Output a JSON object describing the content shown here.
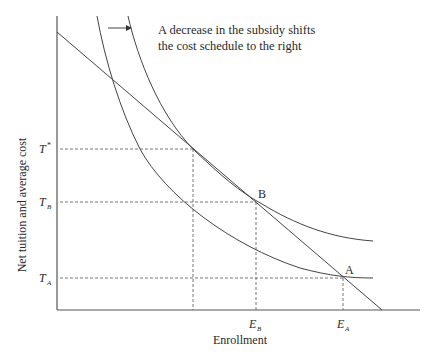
{
  "diagram": {
    "annotation": {
      "line1": "A decrease in the subsidy shifts",
      "line2": "the cost schedule to the right"
    },
    "axes": {
      "ylabel": "Net tuition and average cost",
      "xlabel": "Enrollment"
    },
    "y_ticks": [
      {
        "main": "T",
        "sup": "*",
        "sub": ""
      },
      {
        "main": "T",
        "sup": "",
        "sub": "B"
      },
      {
        "main": "T",
        "sup": "",
        "sub": "A"
      }
    ],
    "x_ticks": [
      {
        "main": "E",
        "sub": "B"
      },
      {
        "main": "E",
        "sub": "A"
      }
    ],
    "points": {
      "B": "B",
      "A": "A"
    },
    "colors": {
      "line": "#444444",
      "axis": "#555555",
      "text": "#2a2a2a"
    }
  }
}
